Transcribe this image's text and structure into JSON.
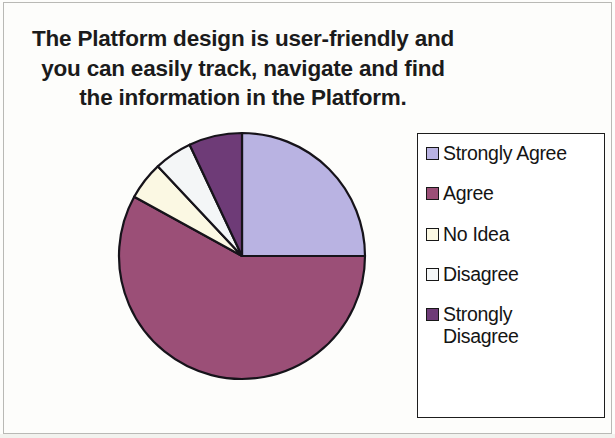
{
  "chart": {
    "title": "The Platform design is user-friendly and you can easily track, navigate and find the information in the Platform."
  },
  "chart_data": {
    "type": "pie",
    "title": "The Platform design is user-friendly and you can easily track, navigate and find the information in the Platform.",
    "xlabel": "",
    "ylabel": "",
    "legend_position": "right",
    "grid": false,
    "start_angle_deg": 0,
    "direction": "clockwise",
    "categories": [
      "Strongly Agree",
      "Agree",
      "No Idea",
      "Disagree",
      "Strongly Disagree"
    ],
    "values": [
      25,
      58,
      5,
      5,
      7
    ],
    "units": "percent",
    "colors": [
      "#b9b3e2",
      "#9b4f77",
      "#fbf8e3",
      "#f4f6f7",
      "#6e3b77"
    ],
    "slices": [
      {
        "label": "Strongly Agree",
        "value": 25,
        "color": "#b9b3e2",
        "start_deg": 0,
        "end_deg": 90
      },
      {
        "label": "Agree",
        "value": 58,
        "color": "#9b4f77",
        "start_deg": 90,
        "end_deg": 298.8
      },
      {
        "label": "No Idea",
        "value": 5,
        "color": "#fbf8e3",
        "start_deg": 298.8,
        "end_deg": 316.8
      },
      {
        "label": "Disagree",
        "value": 5,
        "color": "#f4f6f7",
        "start_deg": 316.8,
        "end_deg": 334.8
      },
      {
        "label": "Strongly Disagree",
        "value": 7,
        "color": "#6e3b77",
        "start_deg": 334.8,
        "end_deg": 360
      }
    ]
  },
  "legend": {
    "items": [
      {
        "label": "Strongly Agree",
        "color": "#b9b3e2"
      },
      {
        "label": "Agree",
        "color": "#9b4f77"
      },
      {
        "label": "No Idea",
        "color": "#fbf8e3"
      },
      {
        "label": "Disagree",
        "color": "#f4f6f7"
      },
      {
        "label": "Strongly\nDisagree",
        "color": "#6e3b77"
      }
    ]
  }
}
